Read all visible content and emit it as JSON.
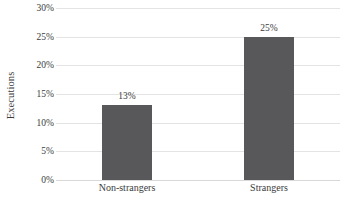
{
  "chart_data": {
    "type": "bar",
    "title": "",
    "xlabel": "",
    "ylabel": "Executions",
    "categories": [
      "Non-strangers",
      "Strangers"
    ],
    "values": [
      13,
      25
    ],
    "value_labels": [
      "13%",
      "25%"
    ],
    "ylim": [
      0,
      30
    ],
    "ytick_values": [
      0,
      5,
      10,
      15,
      20,
      25,
      30
    ],
    "ytick_labels": [
      "0%",
      "5%",
      "10%",
      "15%",
      "20%",
      "25%",
      "30%"
    ],
    "grid": true,
    "legend": false,
    "bar_color": "#58585a",
    "gridline_color": "#e3e3e3",
    "background_color": "#ffffff",
    "text_color": "#3b3b3b"
  }
}
